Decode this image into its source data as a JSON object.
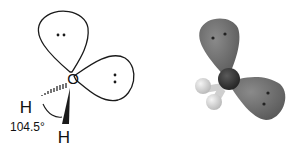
{
  "diagram": {
    "left": {
      "description": "Line drawing of water molecule with two lone-pair lobes",
      "central_atom": "O",
      "hydrogen_1": "H",
      "hydrogen_2": "H",
      "bond_angle": "104.5°",
      "lone_pair_1": "••",
      "lone_pair_2": ":",
      "colors": {
        "line": "#1a1a1a",
        "fill": "#ffffff"
      }
    },
    "right": {
      "description": "3D shaded model of water with lone-pair lobes",
      "colors": {
        "lobe": "#6e6e6e",
        "oxygen": "#3a3a3a",
        "hydrogen": "#d8d8d8",
        "dots": "#222222"
      }
    }
  }
}
